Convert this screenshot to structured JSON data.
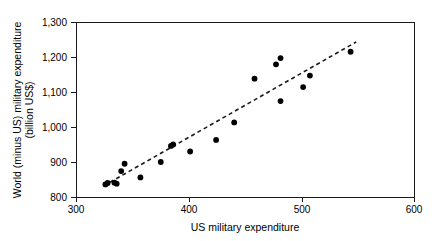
{
  "chart_data": {
    "type": "scatter",
    "title": "",
    "xlabel": "US military expenditure",
    "ylabel_line1": "World (minus US) military expenditure",
    "ylabel_line2": "(billion US$)",
    "xlim": [
      300,
      600
    ],
    "ylim": [
      800,
      1300
    ],
    "xticks": [
      300,
      400,
      500,
      600
    ],
    "xtick_labels": [
      "300",
      "400",
      "500",
      "600"
    ],
    "yticks": [
      800,
      900,
      1000,
      1100,
      1200,
      1300
    ],
    "ytick_labels": [
      "800",
      "900",
      "1,000",
      "1,100",
      "1,200",
      "1,300"
    ],
    "grid": false,
    "legend": false,
    "marker_color": "#000000",
    "axis_color": "#1a1a1a",
    "points": [
      {
        "x": 326,
        "y": 836
      },
      {
        "x": 328,
        "y": 840
      },
      {
        "x": 334,
        "y": 841
      },
      {
        "x": 336,
        "y": 838
      },
      {
        "x": 340,
        "y": 874
      },
      {
        "x": 343,
        "y": 895
      },
      {
        "x": 357,
        "y": 856
      },
      {
        "x": 375,
        "y": 900
      },
      {
        "x": 384,
        "y": 946
      },
      {
        "x": 386,
        "y": 950
      },
      {
        "x": 401,
        "y": 930
      },
      {
        "x": 424,
        "y": 963
      },
      {
        "x": 440,
        "y": 1013
      },
      {
        "x": 458,
        "y": 1138
      },
      {
        "x": 477,
        "y": 1179
      },
      {
        "x": 481,
        "y": 1197
      },
      {
        "x": 481,
        "y": 1074
      },
      {
        "x": 501,
        "y": 1114
      },
      {
        "x": 507,
        "y": 1147
      },
      {
        "x": 543,
        "y": 1215
      }
    ],
    "trend_line": {
      "style": "dashed",
      "x_start": 330,
      "y_start": 842,
      "x_end": 548,
      "y_end": 1243
    }
  },
  "axes": {
    "plot_left_px": 76,
    "plot_right_px": 415,
    "plot_top_px": 22,
    "plot_bottom_px": 197
  }
}
